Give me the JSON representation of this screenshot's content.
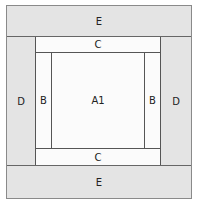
{
  "diagram": {
    "regions": {
      "top": "E",
      "bottom": "E",
      "left": "D",
      "right": "D",
      "inner_top": "C",
      "inner_bottom": "C",
      "inner_left": "B",
      "inner_right": "B",
      "center": "A1"
    },
    "colors": {
      "border_fill": "#e4e4e4",
      "inner_fill": "#fbfbfb",
      "line": "#555555"
    }
  }
}
